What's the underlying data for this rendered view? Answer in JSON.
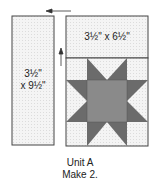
{
  "left_panel": {
    "line1": "3½\"",
    "line2": "x 9½\""
  },
  "top_panel": {
    "label": "3½\" x 6½\""
  },
  "caption": {
    "line1": "Unit A",
    "line2": "Make 2."
  },
  "colors": {
    "background_fabric": "#f3f3f3",
    "star_points": "#6b6b6b",
    "center_square": "#8a8a8a",
    "outline": "#444444"
  }
}
